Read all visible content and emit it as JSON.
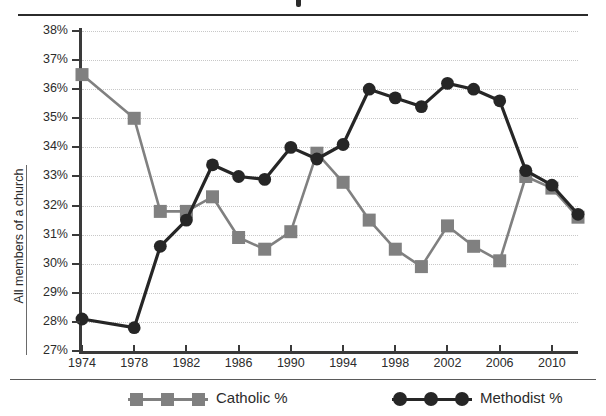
{
  "chart_data": {
    "type": "line",
    "title": "",
    "xlabel": "",
    "ylabel": "All members of a church",
    "ylim": [
      27,
      38
    ],
    "ytick_labels": [
      "38%",
      "37%",
      "36%",
      "35%",
      "34%",
      "33%",
      "32%",
      "31%",
      "30%",
      "29%",
      "28%",
      "27%"
    ],
    "ytick_values": [
      38,
      37,
      36,
      35,
      34,
      33,
      32,
      31,
      30,
      29,
      28,
      27
    ],
    "y_unit": "%",
    "grid": true,
    "xtick_labels": [
      "1974",
      "1978",
      "1982",
      "1986",
      "1990",
      "1994",
      "1998",
      "2002",
      "2006",
      "2010"
    ],
    "xtick_values": [
      1974,
      1978,
      1982,
      1986,
      1990,
      1994,
      1998,
      2002,
      2006,
      2010
    ],
    "xlim": [
      1974,
      2012
    ],
    "x": [
      1974,
      1976,
      1978,
      1980,
      1982,
      1984,
      1986,
      1988,
      1990,
      1992,
      1994,
      1996,
      1998,
      2000,
      2002,
      2004,
      2006,
      2008,
      2010,
      2012
    ],
    "legend_position": "bottom",
    "series": [
      {
        "name": "Catholic %",
        "marker": "square",
        "color": "#808080",
        "values": [
          36.5,
          null,
          35.0,
          31.8,
          31.8,
          32.3,
          30.9,
          30.5,
          31.1,
          33.8,
          32.8,
          31.5,
          30.5,
          29.9,
          31.3,
          30.6,
          30.1,
          33.0,
          32.6,
          31.6
        ]
      },
      {
        "name": "Methodist %",
        "marker": "circle",
        "color": "#262626",
        "values": [
          28.1,
          null,
          27.8,
          30.6,
          31.5,
          33.4,
          33.0,
          32.9,
          34.0,
          33.6,
          34.1,
          36.0,
          35.7,
          35.4,
          36.2,
          36.0,
          35.6,
          33.2,
          32.7,
          31.7
        ]
      }
    ]
  },
  "legend": {
    "catholic_label": "Catholic %",
    "methodist_label": "Methodist %"
  },
  "colors": {
    "catholic": "#808080",
    "methodist": "#262626",
    "axis": "#3a3a3a",
    "grid": "#c8c8c8",
    "rule": "#2b2b2b"
  }
}
